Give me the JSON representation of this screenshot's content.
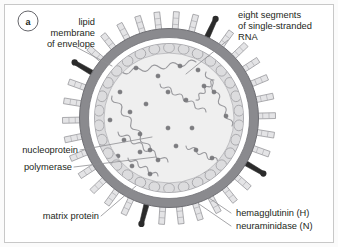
{
  "figure": {
    "panel_letter": "a",
    "frame_color": "#c8c8c8",
    "background_color": "#fbfbfb"
  },
  "labels": {
    "lipid_membrane": {
      "lines": [
        "lipid",
        "membrane",
        "of envelope"
      ],
      "line1": "lipid",
      "line2": "membrane",
      "line3": "of envelope"
    },
    "rna_segments": {
      "lines": [
        "eight segments",
        "of single-stranded",
        "RNA"
      ],
      "line1": "eight segments",
      "line2": "of single-stranded",
      "line3": "RNA"
    },
    "nucleoprotein": "nucleoprotein",
    "polymerase": "polymerase",
    "matrix_protein": "matrix protein",
    "hemagglutinin": "hemagglutinin (H)",
    "neuraminidase": "neuraminidase (N)"
  },
  "colors": {
    "envelope_outer": "#8a8a8e",
    "envelope_inner_ring": "#b9b9bd",
    "matrix_layer": "#d2d2d4",
    "matrix_cell_fill": "#dcdcde",
    "core_fill": "#efefef",
    "rna_strand": "#9a9a9e",
    "nucleoprotein_dot": "#7c7c80",
    "hemagglutinin_spike": "#e4e4e6",
    "neuraminidase_spike": "#2b2b2b",
    "leader_line": "#8e8e92",
    "text": "#231f20"
  }
}
